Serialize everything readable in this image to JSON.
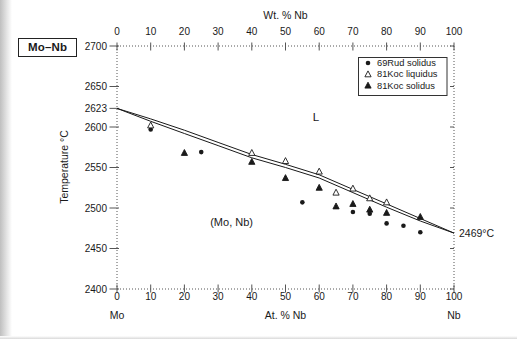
{
  "figure": {
    "label": "Mo–Nb"
  },
  "chart_data": {
    "type": "scatter",
    "x_range": [
      0,
      100
    ],
    "y_range": [
      2400,
      2700
    ],
    "top_axis": {
      "label": "Wt. % Nb",
      "ticks": [
        0,
        10,
        20,
        30,
        40,
        50,
        60,
        70,
        80,
        90,
        100
      ]
    },
    "bottom_axis": {
      "label": "At. % Nb",
      "ticks": [
        0,
        10,
        20,
        30,
        40,
        50,
        60,
        70,
        80,
        90,
        100
      ],
      "left_end_label": "Mo",
      "right_end_label": "Nb"
    },
    "y_axis": {
      "label": "Temperature °C",
      "ticks": [
        2700,
        2650,
        2623,
        2600,
        2550,
        2500,
        2450,
        2400
      ],
      "right_ticks": [
        2700,
        2650,
        2600,
        2550,
        2500,
        2450,
        2400
      ]
    },
    "lines": [
      {
        "name": "liquidus",
        "points": [
          [
            0,
            2623
          ],
          [
            10,
            2610
          ],
          [
            20,
            2596
          ],
          [
            30,
            2581
          ],
          [
            40,
            2566
          ],
          [
            50,
            2554
          ],
          [
            60,
            2541
          ],
          [
            70,
            2523
          ],
          [
            80,
            2505
          ],
          [
            90,
            2487
          ],
          [
            100,
            2469
          ]
        ]
      },
      {
        "name": "solidus",
        "points": [
          [
            0,
            2623
          ],
          [
            10,
            2607
          ],
          [
            20,
            2592
          ],
          [
            30,
            2577
          ],
          [
            40,
            2562
          ],
          [
            50,
            2550
          ],
          [
            60,
            2537
          ],
          [
            70,
            2519
          ],
          [
            80,
            2501
          ],
          [
            90,
            2484
          ],
          [
            100,
            2469
          ]
        ]
      }
    ],
    "series": [
      {
        "name": "69Rud solidus",
        "marker": "filled-circle",
        "points": [
          [
            10,
            2597
          ],
          [
            25,
            2569
          ],
          [
            55,
            2507
          ],
          [
            70,
            2495
          ],
          [
            75,
            2493
          ],
          [
            80,
            2481
          ],
          [
            85,
            2478
          ],
          [
            90,
            2470
          ]
        ]
      },
      {
        "name": "81Koc liquidus",
        "marker": "open-triangle",
        "points": [
          [
            10,
            2602
          ],
          [
            40,
            2568
          ],
          [
            50,
            2558
          ],
          [
            60,
            2545
          ],
          [
            65,
            2519
          ],
          [
            70,
            2524
          ],
          [
            75,
            2512
          ],
          [
            80,
            2507
          ]
        ]
      },
      {
        "name": "81Koc solidus",
        "marker": "filled-triangle",
        "points": [
          [
            20,
            2568
          ],
          [
            40,
            2557
          ],
          [
            50,
            2537
          ],
          [
            60,
            2525
          ],
          [
            65,
            2502
          ],
          [
            70,
            2505
          ],
          [
            75,
            2498
          ],
          [
            80,
            2494
          ],
          [
            90,
            2489
          ]
        ]
      }
    ],
    "legend": {
      "items": [
        {
          "label": "69Rud solidus",
          "marker": "filled-circle"
        },
        {
          "label": "81Koc liquidus",
          "marker": "open-triangle"
        },
        {
          "label": "81Koc solidus",
          "marker": "filled-triangle"
        }
      ]
    },
    "annotations": [
      {
        "text": "L",
        "x": 59,
        "y": 2608,
        "anchor": "middle",
        "size": 11.5
      },
      {
        "text": "(Mo, Nb)",
        "x": 34,
        "y": 2478,
        "anchor": "middle",
        "size": 11
      },
      {
        "text": "2469°C",
        "x": 100,
        "y": 2469,
        "anchor": "start",
        "dx": 5,
        "dy": 3.5,
        "size": 10.5
      }
    ],
    "colors": {
      "ink": "#1a1a1a",
      "frame": "#555555",
      "background": "#ffffff"
    }
  }
}
